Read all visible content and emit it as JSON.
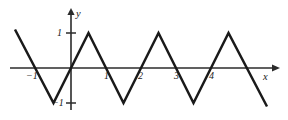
{
  "chart_data": {
    "type": "line",
    "title": "",
    "subtitle": "",
    "xlabel": "x",
    "ylabel": "y",
    "grid": false,
    "legend": null,
    "xlim": [
      -1.6,
      5.85
    ],
    "ylim": [
      -1.2,
      1.2
    ],
    "xticks": [
      -1,
      1,
      2,
      3,
      4
    ],
    "xtick_labels": [
      "−1",
      "1",
      "2",
      "3",
      "4"
    ],
    "yticks": [
      1,
      -1
    ],
    "ytick_labels": [
      "1",
      "−1"
    ],
    "series": [
      {
        "name": "triangle-wave",
        "color": "#1a1a1a",
        "x": [
          -1.6,
          -0.5,
          0.5,
          1.5,
          2.5,
          3.5,
          4.5,
          5.6
        ],
        "y": [
          1.1,
          -1,
          1,
          -1,
          1,
          -1,
          1,
          -1.1
        ]
      }
    ],
    "peaks_x": [
      0.5,
      2.5,
      4.5
    ],
    "peaks_y": [
      1,
      1,
      1
    ],
    "troughs_x": [
      -0.5,
      1.5,
      3.5
    ],
    "troughs_y": [
      -1,
      -1,
      -1
    ],
    "zero_crossings": [
      -1,
      0,
      1,
      2,
      3,
      4,
      5
    ]
  },
  "axes": {
    "x_axis_name": "x",
    "y_axis_name": "y",
    "origin_label": ""
  },
  "labels": {
    "y_top": "1",
    "y_bottom": "−1",
    "x_neg1": "−1",
    "x_1": "1",
    "x_2": "2",
    "x_3": "3",
    "x_4": "4",
    "x_axis": "x",
    "y_axis": "y"
  }
}
